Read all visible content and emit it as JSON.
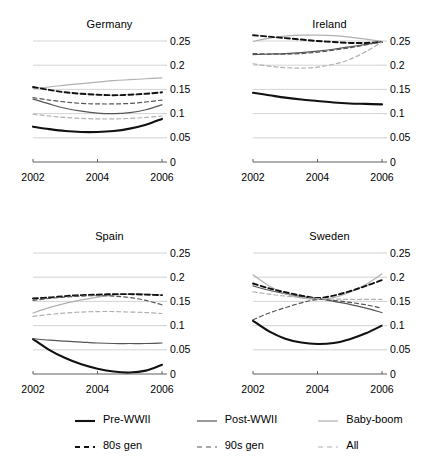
{
  "chart_data": {
    "type": "line",
    "title": "",
    "xlabel": "",
    "ylabel": "",
    "xlim": [
      2002,
      2006
    ],
    "ylim": [
      0,
      0.25
    ],
    "xticks": [
      2002,
      2004,
      2006
    ],
    "xtick_labels": [
      "2002",
      "2004",
      "2006"
    ],
    "yticks": [
      0,
      0.05,
      0.1,
      0.15,
      0.2,
      0.25
    ],
    "ytick_labels": [
      "0",
      "0.05",
      "0.1",
      "0.15",
      "0.2",
      "0.25"
    ],
    "grid": true,
    "grid_axis": "y",
    "legend_position": "bottom",
    "axis_label_side": "right",
    "series_styles": [
      {
        "name": "Pre-WWII",
        "color": "#111111",
        "width": 2.1,
        "dash": "none",
        "key": "pre_wwii"
      },
      {
        "name": "Post-WWII",
        "color": "#555555",
        "width": 1.2,
        "dash": "none",
        "key": "post_wwii"
      },
      {
        "name": "Baby-boom",
        "color": "#b0b0b0",
        "width": 1.2,
        "dash": "none",
        "key": "baby_boom"
      },
      {
        "name": "80s gen",
        "color": "#111111",
        "width": 1.9,
        "dash": "5,3",
        "key": "gen80"
      },
      {
        "name": "90s gen",
        "color": "#555555",
        "width": 1.2,
        "dash": "4,3",
        "key": "gen90"
      },
      {
        "name": "All",
        "color": "#b0b0b0",
        "width": 1.2,
        "dash": "4,3",
        "key": "all"
      }
    ],
    "panels": [
      {
        "title": "Germany",
        "x": [
          2002,
          2002.5,
          2003,
          2003.5,
          2004,
          2004.5,
          2005,
          2005.5,
          2006
        ],
        "series": [
          {
            "name": "Pre-WWII",
            "key": "pre_wwii",
            "values": [
              0.073,
              0.068,
              0.064,
              0.062,
              0.062,
              0.064,
              0.069,
              0.077,
              0.089
            ]
          },
          {
            "name": "Post-WWII",
            "key": "post_wwii",
            "values": [
              0.13,
              0.12,
              0.111,
              0.105,
              0.101,
              0.1,
              0.102,
              0.108,
              0.118
            ]
          },
          {
            "name": "Baby-boom",
            "key": "baby_boom",
            "values": [
              0.152,
              0.155,
              0.159,
              0.162,
              0.165,
              0.168,
              0.17,
              0.172,
              0.174
            ]
          },
          {
            "name": "80s gen",
            "key": "gen80",
            "values": [
              0.155,
              0.149,
              0.144,
              0.141,
              0.139,
              0.138,
              0.139,
              0.141,
              0.144
            ]
          },
          {
            "name": "90s gen",
            "key": "gen90",
            "values": [
              0.133,
              0.128,
              0.124,
              0.121,
              0.12,
              0.12,
              0.121,
              0.124,
              0.128
            ]
          },
          {
            "name": "All",
            "key": "all",
            "values": [
              0.099,
              0.095,
              0.092,
              0.09,
              0.089,
              0.089,
              0.09,
              0.092,
              0.095
            ]
          }
        ]
      },
      {
        "title": "Ireland",
        "x": [
          2002,
          2002.5,
          2003,
          2003.5,
          2004,
          2004.5,
          2005,
          2005.5,
          2006
        ],
        "series": [
          {
            "name": "Pre-WWII",
            "key": "pre_wwii",
            "values": [
              0.143,
              0.138,
              0.133,
              0.129,
              0.126,
              0.123,
              0.121,
              0.12,
              0.119
            ]
          },
          {
            "name": "Post-WWII",
            "key": "post_wwii",
            "values": [
              0.222,
              0.223,
              0.224,
              0.226,
              0.229,
              0.233,
              0.238,
              0.243,
              0.248
            ]
          },
          {
            "name": "Baby-boom",
            "key": "baby_boom",
            "values": [
              0.249,
              0.256,
              0.26,
              0.262,
              0.262,
              0.261,
              0.258,
              0.254,
              0.249
            ]
          },
          {
            "name": "80s gen",
            "key": "gen80",
            "values": [
              0.262,
              0.259,
              0.256,
              0.253,
              0.25,
              0.248,
              0.246,
              0.246,
              0.248
            ]
          },
          {
            "name": "90s gen",
            "key": "gen90",
            "values": [
              0.224,
              0.223,
              0.223,
              0.224,
              0.227,
              0.231,
              0.236,
              0.242,
              0.249
            ]
          },
          {
            "name": "All",
            "key": "all",
            "values": [
              0.203,
              0.198,
              0.195,
              0.194,
              0.196,
              0.202,
              0.212,
              0.228,
              0.248
            ]
          }
        ]
      },
      {
        "title": "Spain",
        "x": [
          2002,
          2002.5,
          2003,
          2003.5,
          2004,
          2004.5,
          2005,
          2005.5,
          2006
        ],
        "series": [
          {
            "name": "Pre-WWII",
            "key": "pre_wwii",
            "values": [
              0.072,
              0.05,
              0.033,
              0.02,
              0.011,
              0.005,
              0.003,
              0.007,
              0.019
            ]
          },
          {
            "name": "Post-WWII",
            "key": "post_wwii",
            "values": [
              0.073,
              0.07,
              0.068,
              0.066,
              0.064,
              0.063,
              0.063,
              0.063,
              0.064
            ]
          },
          {
            "name": "Baby-boom",
            "key": "baby_boom",
            "values": [
              0.126,
              0.137,
              0.146,
              0.153,
              0.159,
              0.163,
              0.165,
              0.165,
              0.163
            ]
          },
          {
            "name": "80s gen",
            "key": "gen80",
            "values": [
              0.156,
              0.158,
              0.161,
              0.163,
              0.164,
              0.165,
              0.165,
              0.164,
              0.163
            ]
          },
          {
            "name": "90s gen",
            "key": "gen90",
            "values": [
              0.152,
              0.156,
              0.159,
              0.161,
              0.162,
              0.161,
              0.158,
              0.152,
              0.143
            ]
          },
          {
            "name": "All",
            "key": "all",
            "values": [
              0.119,
              0.123,
              0.126,
              0.128,
              0.129,
              0.129,
              0.128,
              0.127,
              0.125
            ]
          }
        ]
      },
      {
        "title": "Sweden",
        "x": [
          2002,
          2002.5,
          2003,
          2003.5,
          2004,
          2004.5,
          2005,
          2005.5,
          2006
        ],
        "series": [
          {
            "name": "Pre-WWII",
            "key": "pre_wwii",
            "values": [
              0.11,
              0.088,
              0.073,
              0.065,
              0.062,
              0.064,
              0.072,
              0.084,
              0.1
            ]
          },
          {
            "name": "Post-WWII",
            "key": "post_wwii",
            "values": [
              0.182,
              0.173,
              0.166,
              0.16,
              0.156,
              0.15,
              0.144,
              0.136,
              0.127
            ]
          },
          {
            "name": "Baby-boom",
            "key": "baby_boom",
            "values": [
              0.205,
              0.182,
              0.166,
              0.157,
              0.154,
              0.158,
              0.169,
              0.185,
              0.207
            ]
          },
          {
            "name": "80s gen",
            "key": "gen80",
            "values": [
              0.187,
              0.177,
              0.169,
              0.162,
              0.157,
              0.162,
              0.171,
              0.182,
              0.194
            ]
          },
          {
            "name": "90s gen",
            "key": "gen90",
            "values": [
              0.112,
              0.126,
              0.137,
              0.147,
              0.154,
              0.152,
              0.148,
              0.143,
              0.136
            ]
          },
          {
            "name": "All",
            "key": "all",
            "values": [
              0.17,
              0.165,
              0.161,
              0.158,
              0.156,
              0.155,
              0.154,
              0.154,
              0.154
            ]
          }
        ]
      }
    ]
  },
  "legend": {
    "rows": [
      [
        {
          "label": "Pre-WWII",
          "style": "solid-thick-black"
        },
        {
          "label": "Post-WWII",
          "style": "solid-gray"
        },
        {
          "label": "Baby-boom",
          "style": "solid-light"
        }
      ],
      [
        {
          "label": "80s gen",
          "style": "dashed-black"
        },
        {
          "label": "90s gen",
          "style": "dashed-gray"
        },
        {
          "label": "All",
          "style": "dashed-light"
        }
      ]
    ]
  }
}
